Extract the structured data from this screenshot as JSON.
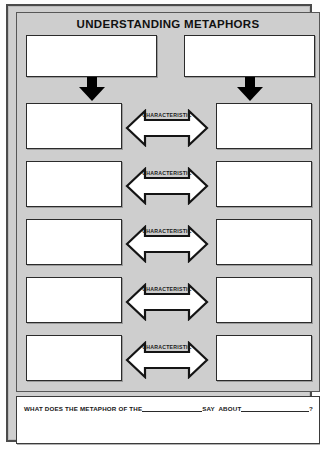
{
  "worksheet": {
    "title": "UNDERSTANDING METAPHORS",
    "top_boxes": [
      {
        "name": "metaphor-subject-box",
        "value": ""
      },
      {
        "name": "metaphor-comparison-box",
        "value": ""
      }
    ],
    "connector_icons": [
      "down-arrow-icon",
      "down-arrow-icon"
    ],
    "rows": [
      {
        "left_value": "",
        "label": "CHARACTERISTIC",
        "right_value": ""
      },
      {
        "left_value": "",
        "label": "CHARACTERISTIC",
        "right_value": ""
      },
      {
        "left_value": "",
        "label": "CHARACTERISTIC",
        "right_value": ""
      },
      {
        "left_value": "",
        "label": "CHARACTERISTIC",
        "right_value": ""
      },
      {
        "left_value": "",
        "label": "CHARACTERISTIC",
        "right_value": ""
      }
    ],
    "answer": {
      "prompt_part_1": "WHAT DOES THE METAPHOR OF THE",
      "prompt_part_2": "SAY  ABOUT",
      "prompt_part_3": "?",
      "response_value": ""
    },
    "colors": {
      "page_background": "#fdfdfd",
      "organizer_background": "#cecece",
      "box_fill": "#ffffff",
      "border": "#2b2b2b",
      "arrow_fill": "#000000"
    }
  }
}
